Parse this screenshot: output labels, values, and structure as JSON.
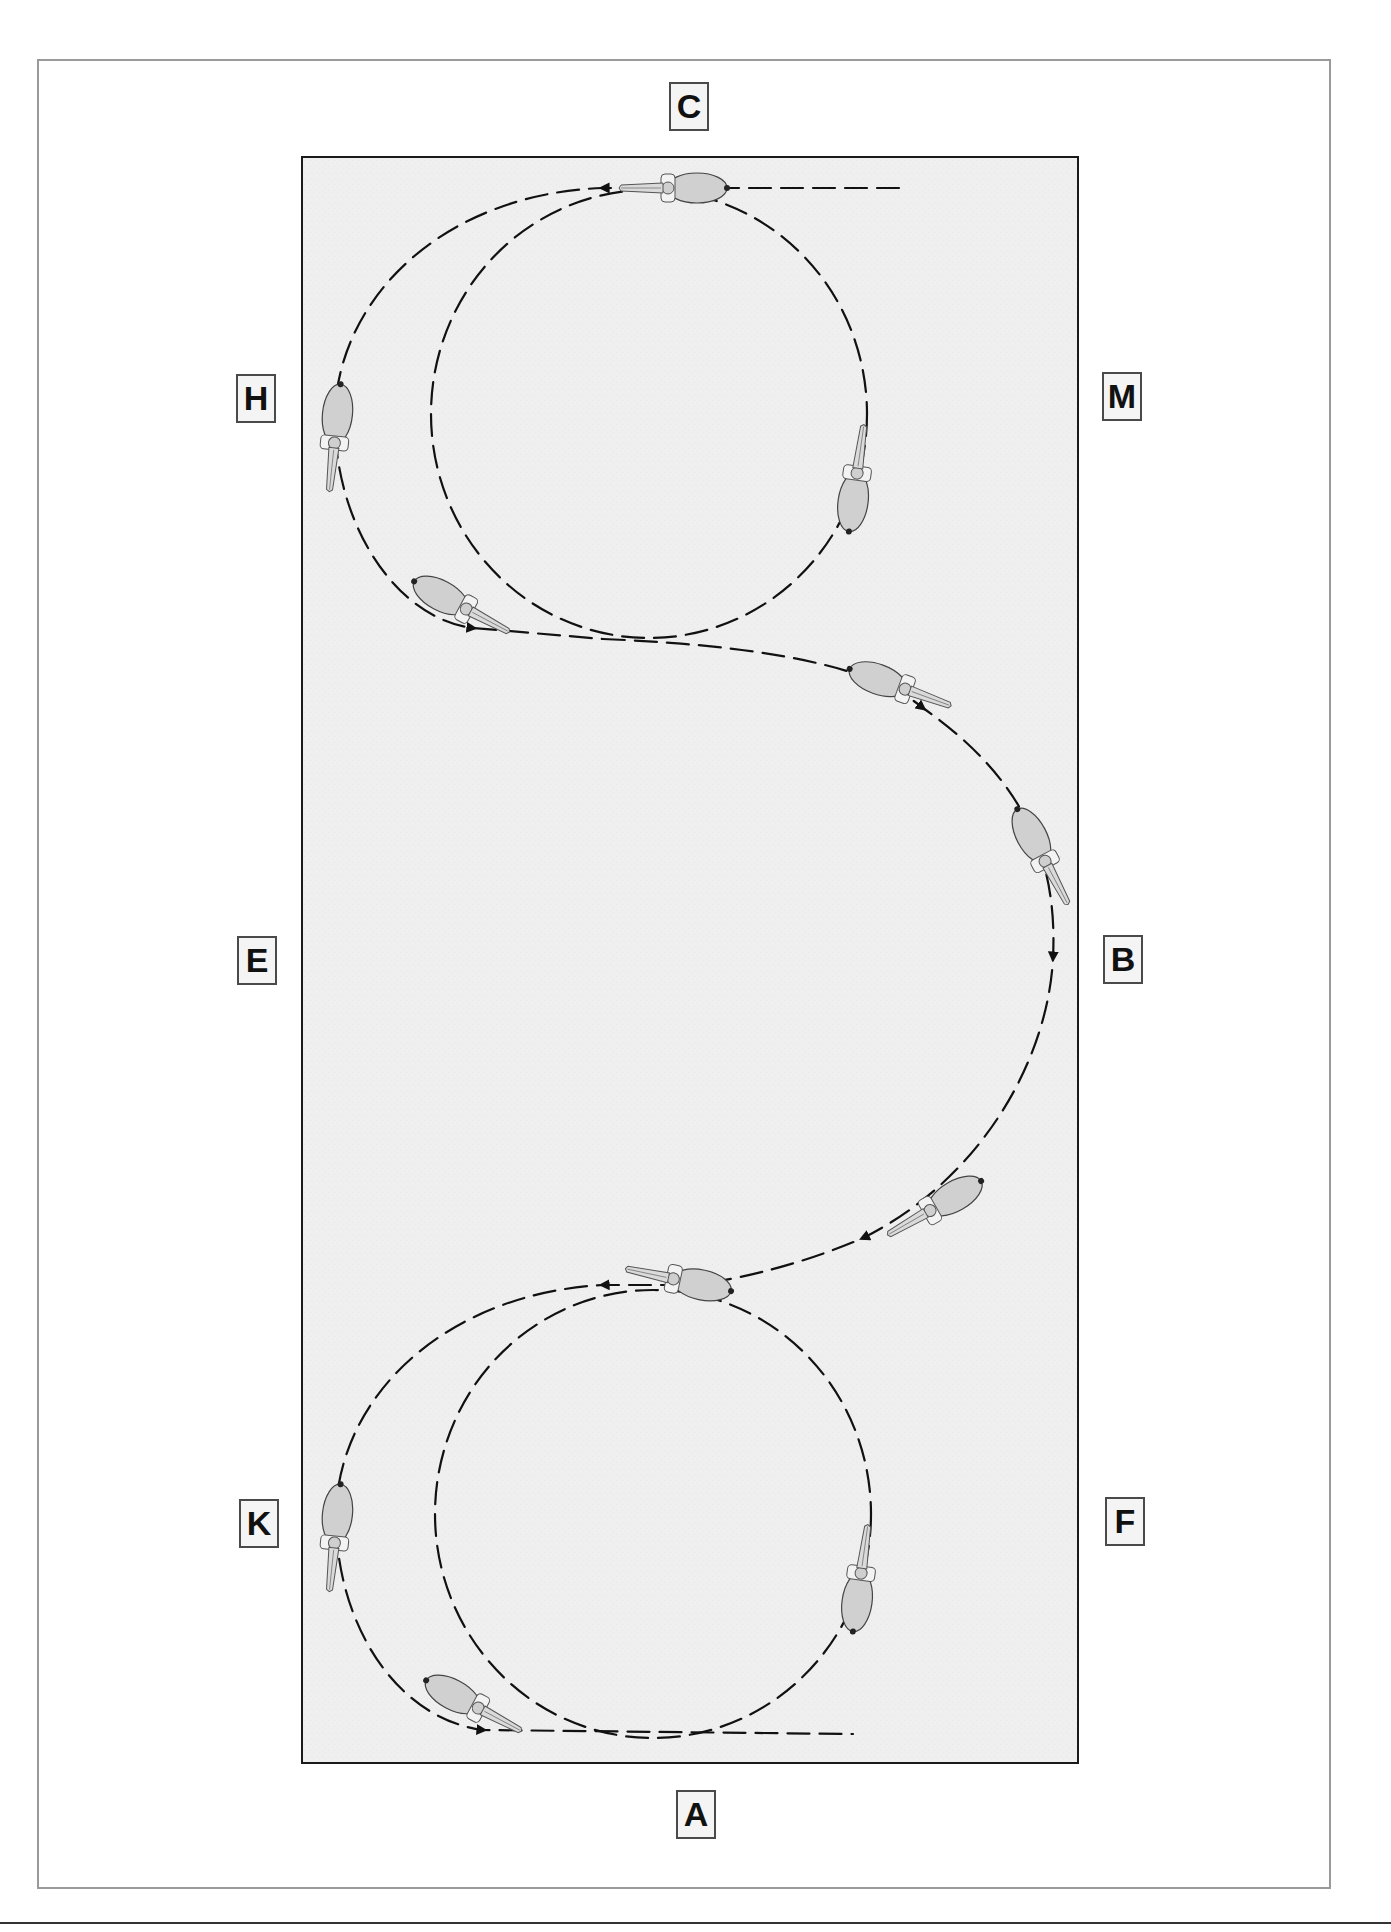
{
  "diagram": {
    "type": "dressage-arena-figure",
    "arena": {
      "fill": "#efefef",
      "border": "#1a1a1a"
    },
    "path_color": "#111111",
    "horse_color": "#cfcfcf"
  },
  "markers": {
    "C": "C",
    "H": "H",
    "M": "M",
    "E": "E",
    "B": "B",
    "K": "K",
    "F": "F",
    "A": "A"
  },
  "marker_positions": [
    {
      "letter": "C",
      "side": "top"
    },
    {
      "letter": "H",
      "side": "left-upper"
    },
    {
      "letter": "M",
      "side": "right-upper"
    },
    {
      "letter": "E",
      "side": "left-middle"
    },
    {
      "letter": "B",
      "side": "right-middle"
    },
    {
      "letter": "K",
      "side": "left-lower"
    },
    {
      "letter": "F",
      "side": "right-lower"
    },
    {
      "letter": "A",
      "side": "bottom"
    }
  ],
  "horses": [
    {
      "id": 1,
      "location": "top near C",
      "heading": "left"
    },
    {
      "id": 2,
      "location": "left near H",
      "heading": "down"
    },
    {
      "id": 3,
      "location": "lower-left of top loop",
      "heading": "right"
    },
    {
      "id": 4,
      "location": "right of top inner circle near M",
      "heading": "up"
    },
    {
      "id": 5,
      "location": "S-curve upper",
      "heading": "right-down"
    },
    {
      "id": 6,
      "location": "S-curve near B",
      "heading": "down"
    },
    {
      "id": 7,
      "location": "S-curve lower",
      "heading": "left-down"
    },
    {
      "id": 8,
      "location": "top of bottom loop",
      "heading": "left"
    },
    {
      "id": 9,
      "location": "left near K",
      "heading": "down"
    },
    {
      "id": 10,
      "location": "lower-left of bottom loop",
      "heading": "right"
    },
    {
      "id": 11,
      "location": "right of bottom inner circle near F",
      "heading": "up"
    }
  ]
}
